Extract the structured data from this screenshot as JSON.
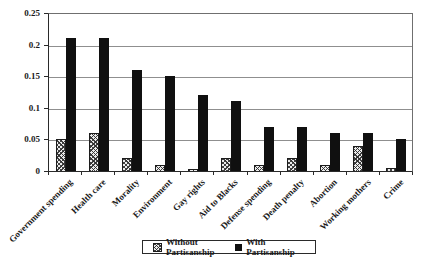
{
  "chart_data": {
    "type": "bar",
    "title": "",
    "xlabel": "",
    "ylabel": "",
    "categories": [
      "Government spending",
      "Health care",
      "Morality",
      "Environment",
      "Gay rights",
      "Aid to Blacks",
      "Defense spending",
      "Death penalty",
      "Abortion",
      "Working mothers",
      "Crime"
    ],
    "series": [
      {
        "name": "Without Partisanship",
        "style": "hatched",
        "values": [
          0.05,
          0.06,
          0.02,
          0.01,
          0.003,
          0.02,
          0.01,
          0.02,
          0.01,
          0.04,
          0.005
        ]
      },
      {
        "name": "With Partisanship",
        "style": "solid",
        "values": [
          0.21,
          0.21,
          0.16,
          0.15,
          0.12,
          0.11,
          0.07,
          0.07,
          0.06,
          0.06,
          0.05
        ]
      }
    ],
    "ylim": [
      0,
      0.25
    ],
    "ytick_labels": [
      "0",
      "0.05",
      "0.1",
      "0.15",
      "0.2",
      "0.25"
    ],
    "grid": true,
    "legend_position": "bottom-center",
    "colors": {
      "solid_bar": "#101010",
      "hatch_ink": "#2d2d2d",
      "hatch_paper": "#ececec",
      "gridline": "#8f8f8f",
      "frame": "#6f6f6f",
      "axis": "#2a2a2a",
      "text": "#1a1a1a"
    }
  }
}
